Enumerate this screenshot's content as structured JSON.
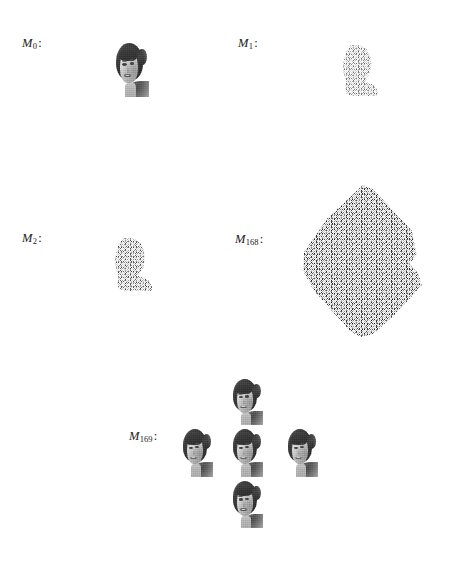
{
  "figure": {
    "type": "diffusion-process-grid",
    "background_color": "#ffffff",
    "text_color": "#1a1a1a",
    "noise_color": "#9a9a9a"
  },
  "panels": [
    {
      "id": "m0",
      "label_base": "M",
      "label_sub": "0",
      "label_colon": ":",
      "content_kind": "face-photo",
      "description": "clean grayscale portrait of a smiling woman with dark hair"
    },
    {
      "id": "m1",
      "label_base": "M",
      "label_sub": "1",
      "label_colon": ":",
      "content_kind": "noisy-face",
      "description": "lightly noised head-and-shoulder silhouette"
    },
    {
      "id": "m2",
      "label_base": "M",
      "label_sub": "2",
      "label_colon": ":",
      "content_kind": "noisy-face",
      "description": "more heavily noised head-and-shoulder silhouette"
    },
    {
      "id": "m168",
      "label_base": "M",
      "label_sub": "168",
      "label_colon": ":",
      "content_kind": "pure-noise",
      "description": "large diamond-shaped field of pure salt-and-pepper noise"
    },
    {
      "id": "m169",
      "label_base": "M",
      "label_sub": "169",
      "label_colon": ":",
      "content_kind": "face-photo-cluster",
      "cluster_count": 5,
      "cluster_arrangement": "plus-diamond",
      "description": "five identical reconstructed portraits arranged in a plus pattern"
    }
  ],
  "caption_fragment": {
    "text": ""
  }
}
